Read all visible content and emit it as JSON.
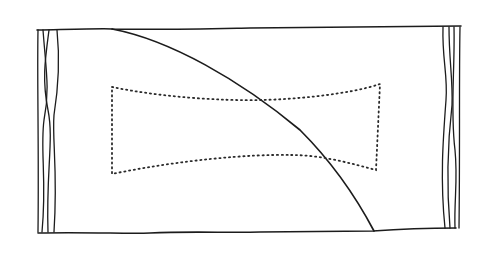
{
  "figure": {
    "type": "hand-drawn line sketch",
    "elements": [
      {
        "name": "rectangle-outline",
        "style": "solid"
      },
      {
        "name": "left-edge-rope-strands",
        "count": 4
      },
      {
        "name": "right-edge-rope-strands",
        "count": 4
      },
      {
        "name": "descending-curve",
        "style": "solid"
      },
      {
        "name": "bowtie-dotted-shape",
        "style": "dotted"
      }
    ],
    "colors": {
      "ink": "#1c1c1c",
      "background": "#ffffff"
    }
  }
}
